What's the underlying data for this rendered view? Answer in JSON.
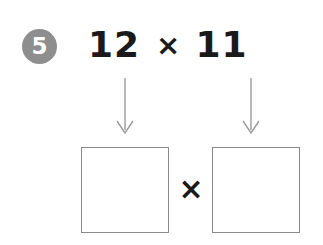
{
  "worksheet": {
    "question_number": "5",
    "problem": {
      "left_operand": "12",
      "operator": "×",
      "right_operand": "11"
    },
    "box_operator": "×",
    "answer_boxes": [
      {
        "label": "",
        "value": ""
      },
      {
        "label": "",
        "value": ""
      }
    ],
    "icons": {
      "arrow_left": "arrow-down-icon",
      "arrow_right": "arrow-down-icon"
    },
    "colors": {
      "badge_background": "#8e8e8e",
      "badge_text": "#ffffff",
      "text": "#1a1a1a",
      "box_border": "#8a8a8a",
      "arrow": "#9a9a9a",
      "page_background": "#ffffff"
    }
  }
}
